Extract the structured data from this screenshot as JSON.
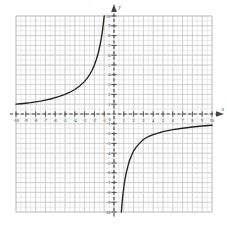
{
  "figure": {
    "kind": "cartesian-graph",
    "background": "#ffffff",
    "minor_grid_color": "#d9d9d9",
    "major_grid_color": "#bfbfbf",
    "axis_color": "#444444",
    "curve_color": "#222222",
    "border_color": "#c8c8c8",
    "top_artifact": "'"
  },
  "chart_data": {
    "type": "line",
    "title": "",
    "subtitle": "",
    "xlabel": "x",
    "ylabel": "y",
    "xlim": [
      -10,
      10
    ],
    "ylim": [
      -10,
      10
    ],
    "grid": true,
    "minor_grid": true,
    "minor_step": 0.5,
    "major_step": 1,
    "legend": "none",
    "x_axis_label_text": "x",
    "y_axis_label_text": "y",
    "x_ticks": [
      -10,
      -9,
      -8,
      -7,
      -6,
      -5,
      -4,
      -3,
      -2,
      -1,
      1,
      2,
      3,
      4,
      5,
      6,
      7,
      8,
      9,
      10
    ],
    "x_tick_labels": [
      "-10",
      "-9",
      "-8",
      "-7",
      "-6",
      "-5",
      "-4",
      "-3",
      "-2",
      "-1",
      "1",
      "2",
      "3",
      "4",
      "5",
      "6",
      "7",
      "8",
      "9",
      "10"
    ],
    "y_ticks": [
      -10,
      -9,
      -8,
      -7,
      -6,
      -5,
      -4,
      -3,
      -2,
      -1,
      1,
      2,
      3,
      4,
      5,
      6,
      7,
      8,
      9,
      10
    ],
    "y_tick_labels": [
      "-10",
      "-9",
      "-8",
      "-7",
      "-6",
      "-5",
      "-4",
      "-3",
      "-2",
      "-1",
      "1",
      "2",
      "3",
      "4",
      "5",
      "6",
      "7",
      "8",
      "9",
      "10"
    ],
    "origin_label": "0",
    "vertical_asymptote": 0,
    "horizontal_asymptote": 0,
    "series": [
      {
        "name": "upper-left-branch",
        "comment": "increasing branch in second quadrant rising to y=10 near x=-1",
        "points": [
          [
            -10.0,
            1.0
          ],
          [
            -9.5,
            1.05
          ],
          [
            -9.0,
            1.1
          ],
          [
            -8.5,
            1.16
          ],
          [
            -8.0,
            1.24
          ],
          [
            -7.5,
            1.32
          ],
          [
            -7.0,
            1.42
          ],
          [
            -6.5,
            1.53
          ],
          [
            -6.0,
            1.67
          ],
          [
            -5.5,
            1.82
          ],
          [
            -5.0,
            2.0
          ],
          [
            -4.5,
            2.22
          ],
          [
            -4.0,
            2.5
          ],
          [
            -3.5,
            2.86
          ],
          [
            -3.0,
            3.33
          ],
          [
            -2.75,
            3.64
          ],
          [
            -2.5,
            4.0
          ],
          [
            -2.25,
            4.44
          ],
          [
            -2.0,
            5.0
          ],
          [
            -1.8,
            5.56
          ],
          [
            -1.6,
            6.25
          ],
          [
            -1.4,
            7.14
          ],
          [
            -1.3,
            7.69
          ],
          [
            -1.2,
            8.33
          ],
          [
            -1.1,
            9.09
          ],
          [
            -1.05,
            9.52
          ],
          [
            -1.0,
            10.0
          ]
        ]
      },
      {
        "name": "lower-right-branch",
        "comment": "branch in fourth quadrant from y=-10 near x=0.75 rising toward y=-1 at x=10",
        "points": [
          [
            0.75,
            -10.0
          ],
          [
            0.8,
            -9.4
          ],
          [
            0.85,
            -8.8
          ],
          [
            0.9,
            -8.3
          ],
          [
            1.0,
            -7.5
          ],
          [
            1.1,
            -6.8
          ],
          [
            1.25,
            -6.0
          ],
          [
            1.4,
            -5.4
          ],
          [
            1.6,
            -4.7
          ],
          [
            1.8,
            -4.2
          ],
          [
            2.0,
            -3.75
          ],
          [
            2.25,
            -3.4
          ],
          [
            2.5,
            -3.1
          ],
          [
            3.0,
            -2.6
          ],
          [
            3.5,
            -2.3
          ],
          [
            4.0,
            -2.1
          ],
          [
            4.5,
            -1.95
          ],
          [
            5.0,
            -1.8
          ],
          [
            6.0,
            -1.6
          ],
          [
            7.0,
            -1.45
          ],
          [
            8.0,
            -1.33
          ],
          [
            9.0,
            -1.22
          ],
          [
            10.0,
            -1.15
          ]
        ]
      }
    ]
  }
}
